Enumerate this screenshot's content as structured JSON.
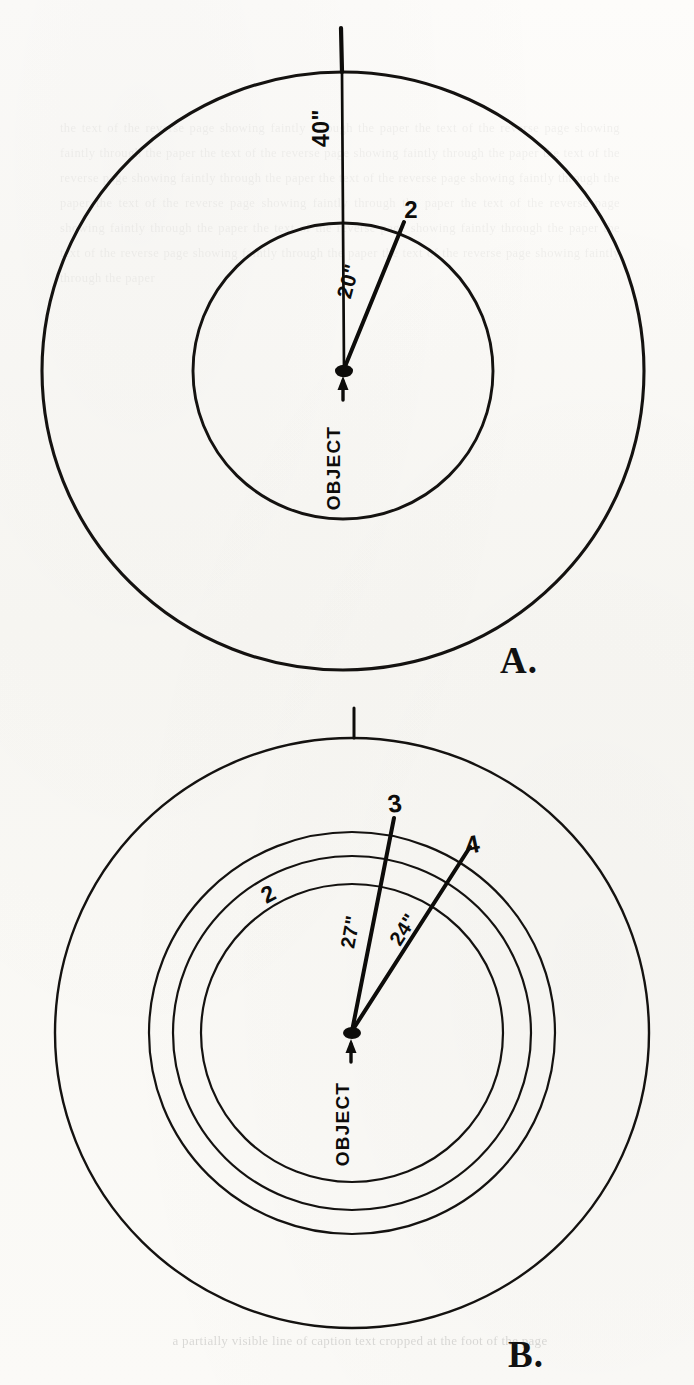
{
  "figure": {
    "background_color": "#fbfaf7",
    "ink_color": "#141210"
  },
  "panels": [
    {
      "id": "A",
      "plate_label": "A.",
      "center_label": "OBJECT",
      "center_arrow": "↑",
      "rings": [
        {
          "name": "outer-ring",
          "radius_px": 300,
          "tick_label": "1"
        },
        {
          "name": "inner-ring",
          "radius_px": 148,
          "tick_label": "2"
        }
      ],
      "radii": [
        {
          "name": "radius-to-1",
          "label": "40\"",
          "endpoint_label": "1",
          "angle_deg": 90
        },
        {
          "name": "radius-to-2",
          "label": "20\"",
          "endpoint_label": "2",
          "angle_deg": 72
        }
      ]
    },
    {
      "id": "B",
      "plate_label": "B.",
      "center_label": "OBJECT",
      "center_arrow": "↑",
      "rings": [
        {
          "name": "outer-ring",
          "radius_px": 297,
          "tick_label": "1"
        },
        {
          "name": "ring-2",
          "radius_px": 203,
          "tick_label": "2"
        },
        {
          "name": "ring-3",
          "radius_px": 179,
          "tick_label": "3"
        },
        {
          "name": "ring-4",
          "radius_px": 151,
          "tick_label": "4"
        }
      ],
      "radii": [
        {
          "name": "radius-to-3",
          "label": "27\"",
          "endpoint_label": "3",
          "angle_deg": 80
        },
        {
          "name": "radius-to-4",
          "label": "24\"",
          "endpoint_label": "4",
          "angle_deg": 53
        }
      ],
      "ring_annotation": {
        "label": "2",
        "name": "ring-number-2"
      }
    }
  ],
  "ghost": {
    "bleed_text": "the text of the reverse page showing faintly through the paper the text of the reverse page showing faintly through the paper the text of the reverse page showing faintly through the paper the text of the reverse page showing faintly through the paper the text of the reverse page showing faintly through the paper the text of the reverse page showing faintly through the paper the text of the reverse page showing faintly through the paper the text of the reverse page showing faintly through the paper the text of the reverse page showing faintly through the paper the text of the reverse page showing faintly through the paper",
    "caption_fragment": "a partially visible line of caption text cropped at the foot of the page"
  }
}
